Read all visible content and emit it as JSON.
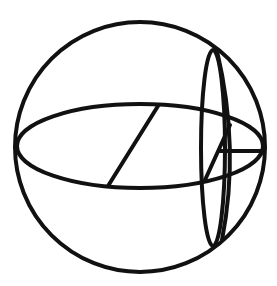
{
  "diagram": {
    "type": "sphere-geometry",
    "colors": {
      "stroke": "#111111",
      "background": "#ffffff"
    },
    "elements": [
      {
        "name": "outer-sphere-circle",
        "shape": "circle",
        "cx": 140,
        "cy": 147,
        "r": 125
      },
      {
        "name": "equator-ellipse",
        "shape": "ellipse",
        "cx": 140,
        "cy": 146,
        "rx": 123,
        "ry": 42
      },
      {
        "name": "equatorial-radius-line",
        "shape": "line",
        "x1": 158,
        "y1": 106,
        "x2": 108,
        "y2": 186
      },
      {
        "name": "small-circle-ellipse",
        "shape": "ellipse",
        "cx": 213,
        "cy": 148,
        "rx": 12,
        "ry": 98
      },
      {
        "name": "meridian-arc",
        "shape": "path",
        "d": "M217,51 Q240,148 222,240"
      },
      {
        "name": "triangle-slant-line",
        "shape": "line",
        "x1": 230,
        "y1": 125,
        "x2": 205,
        "y2": 180
      },
      {
        "name": "horizontal-segment",
        "shape": "line",
        "x1": 220,
        "y1": 151,
        "x2": 262,
        "y2": 151
      }
    ]
  }
}
